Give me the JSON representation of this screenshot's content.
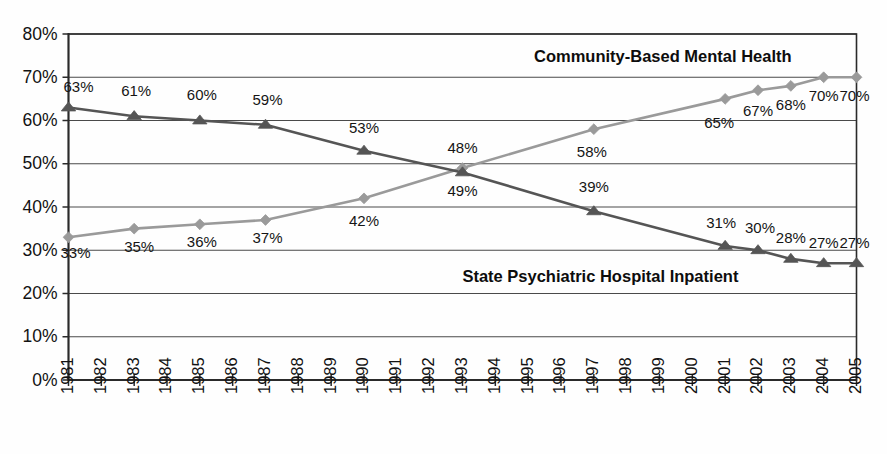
{
  "chart_data": {
    "type": "line",
    "title": "",
    "subtitle": "",
    "xlabel": "",
    "ylabel": "",
    "ylim": [
      0,
      80
    ],
    "y_tick_labels": [
      "0%",
      "10%",
      "20%",
      "30%",
      "40%",
      "50%",
      "60%",
      "70%",
      "80%"
    ],
    "y_ticks": [
      0,
      10,
      20,
      30,
      40,
      50,
      60,
      70,
      80
    ],
    "grid": true,
    "grid_orientation": "horizontal",
    "legend_position": "inline-annotation",
    "x": [
      1981,
      1982,
      1983,
      1984,
      1985,
      1986,
      1987,
      1988,
      1989,
      1990,
      1991,
      1992,
      1993,
      1994,
      1995,
      1996,
      1997,
      1998,
      1999,
      2000,
      2001,
      2002,
      2003,
      2004,
      2005
    ],
    "x_tick_labels": [
      "1981",
      "1982",
      "1983",
      "1984",
      "1985",
      "1986",
      "1987",
      "1988",
      "1989",
      "1990",
      "1991",
      "1992",
      "1993",
      "1994",
      "1995",
      "1996",
      "1997",
      "1998",
      "1999",
      "2000",
      "2001",
      "2002",
      "2003",
      "2004",
      "2005"
    ],
    "series": [
      {
        "name": "Community-Based Mental Health",
        "color": "#9a9a9a",
        "marker": "diamond",
        "label_position": "above-right",
        "points": [
          {
            "x": 1981,
            "y": 33,
            "label": "33%"
          },
          {
            "x": 1983,
            "y": 35,
            "label": "35%"
          },
          {
            "x": 1985,
            "y": 36,
            "label": "36%"
          },
          {
            "x": 1987,
            "y": 37,
            "label": "37%"
          },
          {
            "x": 1990,
            "y": 42,
            "label": "42%"
          },
          {
            "x": 1993,
            "y": 49,
            "label": "49%"
          },
          {
            "x": 1997,
            "y": 58,
            "label": "58%"
          },
          {
            "x": 2001,
            "y": 65,
            "label": "65%"
          },
          {
            "x": 2002,
            "y": 67,
            "label": "67%"
          },
          {
            "x": 2003,
            "y": 68,
            "label": "68%"
          },
          {
            "x": 2004,
            "y": 70,
            "label": "70%"
          },
          {
            "x": 2005,
            "y": 70,
            "label": "70%"
          }
        ]
      },
      {
        "name": "State Psychiatric Hospital Inpatient",
        "color": "#555555",
        "marker": "triangle",
        "label_position": "above",
        "points": [
          {
            "x": 1981,
            "y": 63,
            "label": "63%"
          },
          {
            "x": 1983,
            "y": 61,
            "label": "61%"
          },
          {
            "x": 1985,
            "y": 60,
            "label": "60%"
          },
          {
            "x": 1987,
            "y": 59,
            "label": "59%"
          },
          {
            "x": 1990,
            "y": 53,
            "label": "53%"
          },
          {
            "x": 1993,
            "y": 48,
            "label": "48%"
          },
          {
            "x": 1997,
            "y": 39,
            "label": "39%"
          },
          {
            "x": 2001,
            "y": 31,
            "label": "31%"
          },
          {
            "x": 2002,
            "y": 30,
            "label": "30%"
          },
          {
            "x": 2003,
            "y": 28,
            "label": "28%"
          },
          {
            "x": 2004,
            "y": 27,
            "label": "27%"
          },
          {
            "x": 2005,
            "y": 27,
            "label": "27%"
          }
        ]
      }
    ],
    "annotations": [
      {
        "text": "Community-Based Mental Health",
        "x": 1999.1,
        "y": 74.6,
        "series": "Community-Based Mental Health"
      },
      {
        "text": "State Psychiatric Hospital Inpatient",
        "x": 1997.2,
        "y": 23.7,
        "series": "State Psychiatric Hospital Inpatient"
      }
    ],
    "point_label_offsets": [
      {
        "series": 0,
        "x": 1981,
        "dx": 7,
        "dy": 17
      },
      {
        "series": 0,
        "x": 1983,
        "dx": 5,
        "dy": 19
      },
      {
        "series": 0,
        "x": 1985,
        "dx": 2,
        "dy": 19
      },
      {
        "series": 0,
        "x": 1987,
        "dx": 2,
        "dy": 19
      },
      {
        "series": 0,
        "x": 1990,
        "dx": 0,
        "dy": 24
      },
      {
        "series": 0,
        "x": 1993,
        "dx": 0,
        "dy": 24
      },
      {
        "series": 0,
        "x": 1997,
        "dx": -2,
        "dy": 24
      },
      {
        "series": 0,
        "x": 2001,
        "dx": -6,
        "dy": 25
      },
      {
        "series": 0,
        "x": 2002,
        "dx": 0,
        "dy": 22
      },
      {
        "series": 0,
        "x": 2003,
        "dx": 0,
        "dy": 20
      },
      {
        "series": 0,
        "x": 2004,
        "dx": 0,
        "dy": 20
      },
      {
        "series": 0,
        "x": 2005,
        "dx": -2,
        "dy": 20
      },
      {
        "series": 1,
        "x": 1981,
        "dx": 10,
        "dy": -19
      },
      {
        "series": 1,
        "x": 1983,
        "dx": 2,
        "dy": -24
      },
      {
        "series": 1,
        "x": 1985,
        "dx": 2,
        "dy": -24
      },
      {
        "series": 1,
        "x": 1987,
        "dx": 2,
        "dy": -24
      },
      {
        "series": 1,
        "x": 1990,
        "dx": 0,
        "dy": -22
      },
      {
        "series": 1,
        "x": 1993,
        "dx": 0,
        "dy": -23
      },
      {
        "series": 1,
        "x": 1997,
        "dx": 0,
        "dy": -23
      },
      {
        "series": 1,
        "x": 2001,
        "dx": -4,
        "dy": -22
      },
      {
        "series": 1,
        "x": 2002,
        "dx": 2,
        "dy": -21
      },
      {
        "series": 1,
        "x": 2003,
        "dx": 0,
        "dy": -20
      },
      {
        "series": 1,
        "x": 2004,
        "dx": 0,
        "dy": -19
      },
      {
        "series": 1,
        "x": 2005,
        "dx": -2,
        "dy": -19
      }
    ]
  },
  "colors": {
    "series_light": "#9a9a9a",
    "series_dark": "#555555",
    "grid": "#4a4a4a",
    "frame": "#2a2a2a",
    "text": "#121212",
    "background": "#fefefe"
  }
}
